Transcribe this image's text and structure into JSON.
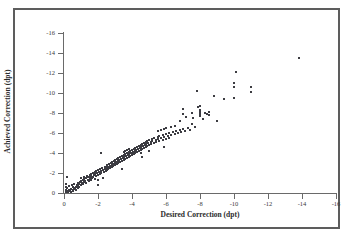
{
  "chart_data": {
    "type": "scatter",
    "title": "",
    "xlabel": "Desired Correction (dpt)",
    "ylabel": "Achieved Correction (dpt)",
    "xlim": [
      0,
      -16
    ],
    "ylim": [
      0,
      -16
    ],
    "xticks": [
      0,
      -2,
      -4,
      -6,
      -8,
      -10,
      -12,
      -14,
      -16
    ],
    "yticks": [
      0,
      -2,
      -4,
      -6,
      -8,
      -10,
      -12,
      -14,
      -16
    ],
    "xtick_labels": [
      "0",
      "-2",
      "-4",
      "-6",
      "-8",
      "-10",
      "-12",
      "-14",
      "-16"
    ],
    "ytick_labels": [
      "0",
      "-2",
      "-4",
      "-6",
      "-8",
      "-10",
      "-12",
      "-14",
      "-16"
    ],
    "grid": false,
    "legend": null,
    "marker": "square",
    "marker_color": "#3c3c42",
    "marker_size_px": 2,
    "axis_color": "#6a6a6a",
    "frame_color": "#5d5d5d",
    "background": "#ffffff",
    "points": [
      [
        -0.1,
        -0.1
      ],
      [
        -0.1,
        -0.3
      ],
      [
        -0.1,
        -0.6
      ],
      [
        -0.1,
        -0.9
      ],
      [
        -0.15,
        -1.6
      ],
      [
        -0.2,
        -0.2
      ],
      [
        -0.2,
        -0.5
      ],
      [
        -0.25,
        -0.1
      ],
      [
        -0.3,
        -0.3
      ],
      [
        -0.3,
        -0.7
      ],
      [
        -0.35,
        -0.2
      ],
      [
        -0.4,
        -0.4
      ],
      [
        -0.4,
        -0.1
      ],
      [
        -0.45,
        -0.8
      ],
      [
        -0.5,
        -0.3
      ],
      [
        -0.5,
        -0.6
      ],
      [
        -0.55,
        -0.2
      ],
      [
        -0.6,
        -0.5
      ],
      [
        -0.6,
        -0.9
      ],
      [
        -0.65,
        -0.4
      ],
      [
        -0.7,
        -0.6
      ],
      [
        -0.7,
        -0.3
      ],
      [
        -0.75,
        -0.8
      ],
      [
        -0.8,
        -0.5
      ],
      [
        -0.8,
        -1.0
      ],
      [
        -0.85,
        -0.7
      ],
      [
        -0.9,
        -0.9
      ],
      [
        -0.9,
        -0.6
      ],
      [
        -0.95,
        -1.1
      ],
      [
        -1.0,
        -0.8
      ],
      [
        -1.0,
        -1.2
      ],
      [
        -1.0,
        -1.5
      ],
      [
        -1.05,
        -1.0
      ],
      [
        -1.1,
        -1.3
      ],
      [
        -1.1,
        -0.9
      ],
      [
        -1.15,
        -1.6
      ],
      [
        -1.2,
        -1.1
      ],
      [
        -1.2,
        -1.4
      ],
      [
        -1.25,
        -1.2
      ],
      [
        -1.3,
        -1.5
      ],
      [
        -1.3,
        -1.0
      ],
      [
        -1.35,
        -1.7
      ],
      [
        -1.4,
        -1.3
      ],
      [
        -1.4,
        -1.6
      ],
      [
        -1.45,
        -1.2
      ],
      [
        -1.5,
        -1.8
      ],
      [
        -1.5,
        -1.4
      ],
      [
        -1.55,
        -1.6
      ],
      [
        -1.6,
        -1.3
      ],
      [
        -1.6,
        -1.9
      ],
      [
        -1.6,
        -1.7
      ],
      [
        -1.65,
        -1.5
      ],
      [
        -1.7,
        -2.0
      ],
      [
        -1.7,
        -1.6
      ],
      [
        -1.75,
        -1.8
      ],
      [
        -1.8,
        -1.4
      ],
      [
        -1.8,
        -2.1
      ],
      [
        -1.85,
        -1.9
      ],
      [
        -1.9,
        -1.7
      ],
      [
        -1.9,
        -2.2
      ],
      [
        -1.95,
        -2.0
      ],
      [
        -2.0,
        -1.8
      ],
      [
        -2.0,
        -2.3
      ],
      [
        -2.0,
        -0.8
      ],
      [
        -2.0,
        -1.3
      ],
      [
        -2.05,
        -2.1
      ],
      [
        -2.1,
        -1.9
      ],
      [
        -2.1,
        -2.4
      ],
      [
        -2.15,
        -2.2
      ],
      [
        -2.2,
        -4.0
      ],
      [
        -2.2,
        -2.0
      ],
      [
        -2.25,
        -2.5
      ],
      [
        -2.3,
        -2.3
      ],
      [
        -2.3,
        -1.5
      ],
      [
        -2.35,
        -2.1
      ],
      [
        -2.4,
        -2.6
      ],
      [
        -2.4,
        -2.4
      ],
      [
        -2.45,
        -2.2
      ],
      [
        -2.5,
        -2.7
      ],
      [
        -2.5,
        -2.5
      ],
      [
        -2.5,
        -2.3
      ],
      [
        -2.55,
        -2.8
      ],
      [
        -2.6,
        -2.6
      ],
      [
        -2.6,
        -2.4
      ],
      [
        -2.65,
        -2.9
      ],
      [
        -2.7,
        -2.7
      ],
      [
        -2.7,
        -2.5
      ],
      [
        -2.75,
        -3.0
      ],
      [
        -2.8,
        -2.8
      ],
      [
        -2.8,
        -2.6
      ],
      [
        -2.85,
        -3.1
      ],
      [
        -2.9,
        -2.9
      ],
      [
        -2.9,
        -2.7
      ],
      [
        -2.95,
        -3.2
      ],
      [
        -3.0,
        -3.0
      ],
      [
        -3.0,
        -2.8
      ],
      [
        -3.0,
        -3.3
      ],
      [
        -3.05,
        -3.1
      ],
      [
        -3.1,
        -2.9
      ],
      [
        -3.1,
        -3.4
      ],
      [
        -3.15,
        -3.2
      ],
      [
        -3.2,
        -3.0
      ],
      [
        -3.2,
        -3.5
      ],
      [
        -3.25,
        -3.3
      ],
      [
        -3.3,
        -3.1
      ],
      [
        -3.3,
        -3.6
      ],
      [
        -3.35,
        -3.4
      ],
      [
        -3.4,
        -3.2
      ],
      [
        -3.4,
        -3.7
      ],
      [
        -3.4,
        -2.4
      ],
      [
        -3.45,
        -3.5
      ],
      [
        -3.5,
        -3.3
      ],
      [
        -3.5,
        -3.8
      ],
      [
        -3.5,
        -4.1
      ],
      [
        -3.55,
        -3.6
      ],
      [
        -3.6,
        -3.4
      ],
      [
        -3.6,
        -3.9
      ],
      [
        -3.6,
        -4.2
      ],
      [
        -3.65,
        -3.7
      ],
      [
        -3.7,
        -3.5
      ],
      [
        -3.7,
        -4.0
      ],
      [
        -3.7,
        -4.3
      ],
      [
        -3.75,
        -3.8
      ],
      [
        -3.8,
        -3.6
      ],
      [
        -3.8,
        -4.1
      ],
      [
        -3.8,
        -4.4
      ],
      [
        -3.85,
        -3.9
      ],
      [
        -3.9,
        -3.7
      ],
      [
        -3.9,
        -4.2
      ],
      [
        -3.95,
        -4.0
      ],
      [
        -4.0,
        -3.8
      ],
      [
        -4.0,
        -4.3
      ],
      [
        -4.0,
        -4.0
      ],
      [
        -4.05,
        -4.1
      ],
      [
        -4.1,
        -3.9
      ],
      [
        -4.1,
        -4.4
      ],
      [
        -4.15,
        -4.2
      ],
      [
        -4.2,
        -4.0
      ],
      [
        -4.2,
        -4.5
      ],
      [
        -4.25,
        -4.3
      ],
      [
        -4.3,
        -4.1
      ],
      [
        -4.3,
        -4.6
      ],
      [
        -4.35,
        -4.4
      ],
      [
        -4.4,
        -4.2
      ],
      [
        -4.4,
        -4.7
      ],
      [
        -4.45,
        -4.5
      ],
      [
        -4.5,
        -4.3
      ],
      [
        -4.5,
        -4.8
      ],
      [
        -4.5,
        -4.0
      ],
      [
        -4.55,
        -4.6
      ],
      [
        -4.6,
        -4.4
      ],
      [
        -4.6,
        -4.9
      ],
      [
        -4.6,
        -3.6
      ],
      [
        -4.65,
        -4.7
      ],
      [
        -4.7,
        -4.5
      ],
      [
        -4.7,
        -5.0
      ],
      [
        -4.75,
        -4.8
      ],
      [
        -4.8,
        -4.6
      ],
      [
        -4.8,
        -5.1
      ],
      [
        -4.85,
        -4.9
      ],
      [
        -4.9,
        -4.7
      ],
      [
        -4.9,
        -5.2
      ],
      [
        -4.95,
        -5.0
      ],
      [
        -5.0,
        -4.8
      ],
      [
        -5.0,
        -5.3
      ],
      [
        -5.0,
        -4.2
      ],
      [
        -5.1,
        -5.1
      ],
      [
        -5.1,
        -4.9
      ],
      [
        -5.2,
        -5.4
      ],
      [
        -5.2,
        -5.2
      ],
      [
        -5.3,
        -5.0
      ],
      [
        -5.3,
        -5.5
      ],
      [
        -5.4,
        -5.3
      ],
      [
        -5.4,
        -5.1
      ],
      [
        -5.5,
        -5.6
      ],
      [
        -5.5,
        -5.4
      ],
      [
        -5.5,
        -6.2
      ],
      [
        -5.6,
        -5.2
      ],
      [
        -5.6,
        -5.7
      ],
      [
        -5.7,
        -5.5
      ],
      [
        -5.7,
        -6.3
      ],
      [
        -5.8,
        -5.3
      ],
      [
        -5.8,
        -5.8
      ],
      [
        -5.9,
        -5.6
      ],
      [
        -5.9,
        -6.4
      ],
      [
        -5.9,
        -4.6
      ],
      [
        -6.0,
        -5.4
      ],
      [
        -6.0,
        -5.9
      ],
      [
        -6.0,
        -6.5
      ],
      [
        -6.1,
        -5.7
      ],
      [
        -6.2,
        -6.0
      ],
      [
        -6.2,
        -5.5
      ],
      [
        -6.3,
        -6.6
      ],
      [
        -6.3,
        -5.8
      ],
      [
        -6.4,
        -6.1
      ],
      [
        -6.5,
        -5.9
      ],
      [
        -6.5,
        -6.7
      ],
      [
        -6.6,
        -6.2
      ],
      [
        -6.7,
        -6.0
      ],
      [
        -6.8,
        -6.3
      ],
      [
        -6.8,
        -7.2
      ],
      [
        -6.9,
        -6.1
      ],
      [
        -7.0,
        -8.4
      ],
      [
        -7.0,
        -6.4
      ],
      [
        -7.0,
        -7.9
      ],
      [
        -7.1,
        -6.2
      ],
      [
        -7.2,
        -7.6
      ],
      [
        -7.3,
        -6.5
      ],
      [
        -7.4,
        -6.3
      ],
      [
        -7.5,
        -8.0
      ],
      [
        -7.5,
        -6.9
      ],
      [
        -7.6,
        -7.5
      ],
      [
        -7.7,
        -6.6
      ],
      [
        -7.8,
        -10.2
      ],
      [
        -7.9,
        -8.6
      ],
      [
        -8.0,
        -8.3
      ],
      [
        -8.0,
        -7.9
      ],
      [
        -8.0,
        -8.1
      ],
      [
        -8.0,
        -7.7
      ],
      [
        -8.0,
        -8.7
      ],
      [
        -8.2,
        -7.4
      ],
      [
        -8.3,
        -8.0
      ],
      [
        -8.4,
        -7.9
      ],
      [
        -8.5,
        -8.1
      ],
      [
        -8.5,
        -7.8
      ],
      [
        -8.8,
        -9.7
      ],
      [
        -9.0,
        -7.2
      ],
      [
        -9.4,
        -9.4
      ],
      [
        -10.0,
        -11.0
      ],
      [
        -10.0,
        -10.6
      ],
      [
        -10.0,
        -9.5
      ],
      [
        -10.1,
        -12.1
      ],
      [
        -11.0,
        -10.6
      ],
      [
        -11.0,
        -10.1
      ],
      [
        -13.8,
        -13.5
      ]
    ]
  }
}
